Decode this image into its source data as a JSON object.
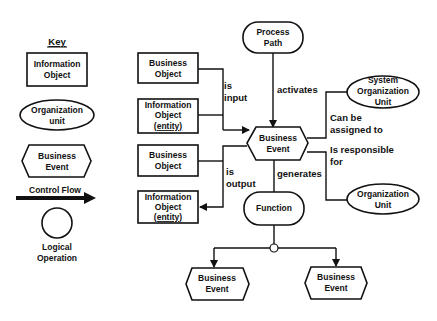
{
  "key": {
    "title": "Key",
    "information_object": [
      "Information",
      "Object"
    ],
    "organization_unit": [
      "Organization",
      "unit"
    ],
    "business_event": [
      "Business",
      "Event"
    ],
    "control_flow": "Control Flow",
    "logical_operation": [
      "Logical",
      "Operation"
    ]
  },
  "nodes": {
    "process_path": [
      "Process",
      "Path"
    ],
    "business_object_input": [
      "Business",
      "Object"
    ],
    "information_object_input": [
      "Information",
      "Object",
      "(entity)"
    ],
    "business_event_center": [
      "Business",
      "Event"
    ],
    "system_org_unit": [
      "System",
      "Organization",
      "Unit"
    ],
    "org_unit": [
      "Organization",
      "Unit"
    ],
    "business_object_output": [
      "Business",
      "Object"
    ],
    "information_object_output": [
      "Information",
      "Object",
      "(entity)"
    ],
    "function": [
      "Function"
    ],
    "business_event_left": [
      "Business",
      "Event"
    ],
    "business_event_right": [
      "Business",
      "Event"
    ]
  },
  "edges": {
    "is_input": [
      "is",
      "input"
    ],
    "activates": "activates",
    "can_be_assigned_to": [
      "Can be",
      "assigned to"
    ],
    "is_responsible_for": [
      "Is responsible",
      "for"
    ],
    "is_output": [
      "is",
      "output"
    ],
    "generates": "generates"
  }
}
